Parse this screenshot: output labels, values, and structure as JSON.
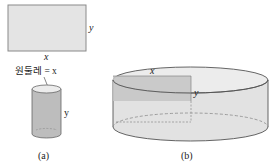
{
  "figure": {
    "panel_a": {
      "caption": "(a)",
      "rectangle": {
        "width_label": "x",
        "height_label": "y"
      },
      "circumference_label": "원둘레 = x",
      "cylinder": {
        "height_label": "y"
      }
    },
    "panel_b": {
      "caption": "(b)",
      "inner_rectangle": {
        "width_label": "x",
        "height_label": "y"
      }
    }
  },
  "colors": {
    "fill_light": "#e6e6e6",
    "fill_mid": "#cfcfcf",
    "fill_dark": "#b8b8b8",
    "stroke": "#555555",
    "dashed": "#8a8a8a"
  }
}
